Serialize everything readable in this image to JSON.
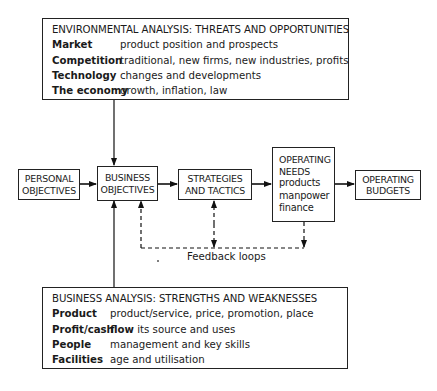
{
  "environmental_analysis": {
    "title": "ENVIRONMENTAL ANALYSIS: THREATS AND OPPORTUNITIES",
    "rows": [
      {
        "key": "Market",
        "value": "product position and prospects"
      },
      {
        "key": "Competition",
        "value": "traditional, new firms, new industries, profits"
      },
      {
        "key": "Technology",
        "value": "changes and developments"
      },
      {
        "key": "The economy",
        "value": "growth, inflation, law"
      }
    ]
  },
  "nodes": {
    "personal_objectives": {
      "line1": "PERSONAL",
      "line2": "OBJECTIVES"
    },
    "business_objectives": {
      "line1": "BUSINESS",
      "line2": "OBJECTIVES"
    },
    "strategies_tactics": {
      "line1": "STRATEGIES",
      "line2": "AND TACTICS"
    },
    "operating_needs": {
      "line1": "OPERATING",
      "line2": "NEEDS",
      "items": [
        "products",
        "manpower",
        "finance"
      ]
    },
    "operating_budgets": {
      "line1": "OPERATING",
      "line2": "BUDGETS"
    }
  },
  "feedback_label": "Feedback loops",
  "business_analysis": {
    "title": "BUSINESS ANALYSIS: STRENGTHS AND WEAKNESSES",
    "rows": [
      {
        "key": "Product",
        "value": "product/service, price, promotion, place"
      },
      {
        "key": "Profit/cash",
        "key_extra": "flow",
        "value": "its source and uses"
      },
      {
        "key": "People",
        "value": "management and key skills"
      },
      {
        "key": "Facilities",
        "value": "age and utilisation"
      }
    ]
  }
}
